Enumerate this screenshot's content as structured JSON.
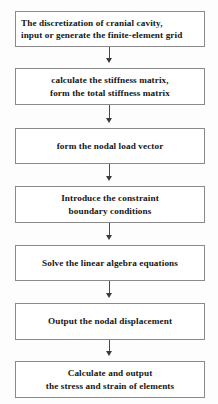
{
  "diagram": {
    "type": "flowchart",
    "orientation": "vertical-top-to-bottom",
    "border_color": "#8a8a8a",
    "box_fill": "#ffffff",
    "text_color": "#161616",
    "connector_color": "#4a4a4a",
    "nodes": [
      {
        "id": "node-1",
        "name": "discretization-step",
        "text": "The discretization of cranial cavity,\ninput or generate the finite-element grid",
        "align": "left",
        "top": 11,
        "height": 36
      },
      {
        "id": "node-2",
        "name": "stiffness-matrix-step",
        "text": "calculate the stiffness matrix,\nform the total stiffness matrix",
        "align": "center",
        "top": 68,
        "height": 37
      },
      {
        "id": "node-3",
        "name": "nodal-load-vector-step",
        "text": "form the nodal load vector",
        "align": "center",
        "top": 128,
        "height": 36
      },
      {
        "id": "node-4",
        "name": "constraint-boundary-step",
        "text": "Introduce the constraint\nboundary conditions",
        "align": "center",
        "top": 186,
        "height": 37
      },
      {
        "id": "node-5",
        "name": "solve-equations-step",
        "text": "Solve the linear algebra equations",
        "align": "center",
        "top": 245,
        "height": 36
      },
      {
        "id": "node-6",
        "name": "output-displacement-step",
        "text": "Output the nodal displacement",
        "align": "center",
        "top": 303,
        "height": 37
      },
      {
        "id": "node-7",
        "name": "stress-strain-step",
        "text": "Calculate and output\nthe stress and strain of elements",
        "align": "center",
        "top": 361,
        "height": 37
      }
    ],
    "connectors": [
      {
        "id": "arrow-1",
        "name": "connector-1-to-2",
        "top": 47,
        "length": 16
      },
      {
        "id": "arrow-2",
        "name": "connector-2-to-3",
        "top": 105,
        "length": 18
      },
      {
        "id": "arrow-3",
        "name": "connector-3-to-4",
        "top": 164,
        "length": 17
      },
      {
        "id": "arrow-4",
        "name": "connector-4-to-5",
        "top": 223,
        "length": 17
      },
      {
        "id": "arrow-5",
        "name": "connector-5-to-6",
        "top": 281,
        "length": 17
      },
      {
        "id": "arrow-6",
        "name": "connector-6-to-7",
        "top": 340,
        "length": 16
      }
    ]
  }
}
